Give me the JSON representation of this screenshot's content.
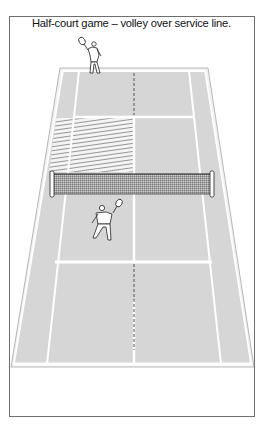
{
  "figure": {
    "caption": "Half-court game – volley over service line.",
    "colors": {
      "court_fill": "#d6d6d6",
      "lines": "#ffffff",
      "frame": "#6e6e6e",
      "net_mesh": "#3a3a3a",
      "hatch": "#555555"
    },
    "elements": {
      "far_player": "player-serving-far-baseline",
      "near_player": "player-volleying-near-court",
      "hatched_zone": "far-left-service-box-and-alley",
      "net": "tennis-net"
    }
  }
}
